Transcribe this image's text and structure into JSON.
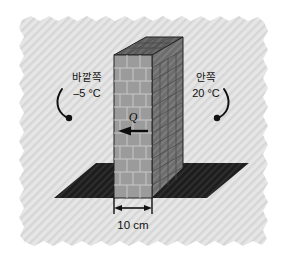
{
  "figure": {
    "background_color": "#ffffff",
    "panel_color": "#e3e3e3",
    "panel_hatch_color": "#d2d2d2"
  },
  "labels": {
    "left": {
      "name_ko": "바깥쪽",
      "temperature": "–5 °C",
      "leader": "curve-left"
    },
    "right": {
      "name_ko": "안쪽",
      "temperature": "20 °C",
      "leader": "curve-right"
    },
    "heat_flow": {
      "symbol": "Q",
      "direction": "left",
      "arrow": "arrow-left-icon"
    },
    "dimension": {
      "value": "10 cm",
      "arrow": "double-arrow-icon"
    }
  },
  "wall": {
    "front_face_color": "#9b9b9b",
    "side_face_color": "#6e6e6e",
    "top_face_color": "#5f5f5f",
    "mortar_color": "#c9c9c9",
    "outline_color": "#2b2b2b",
    "material": "brick"
  },
  "ground": {
    "color": "#212121",
    "shape": "parallelogram"
  }
}
